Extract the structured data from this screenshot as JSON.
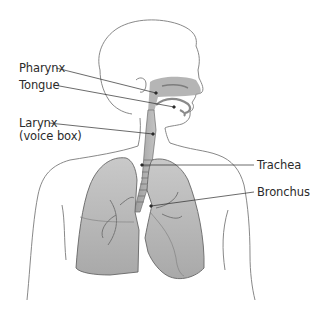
{
  "diagram": {
    "labels": [
      {
        "id": "pharynx",
        "text": "Pharynx",
        "x": 19,
        "y": 62,
        "anchor": [
          56,
          68
        ],
        "target": [
          156,
          93
        ]
      },
      {
        "id": "tongue",
        "text": "Tongue",
        "x": 19,
        "y": 79,
        "anchor": [
          54,
          85
        ],
        "target": [
          174,
          107
        ]
      },
      {
        "id": "larynx",
        "text": "Larynx",
        "sub": "(voice box)",
        "x": 19,
        "y": 117,
        "anchor": [
          49,
          123
        ],
        "target": [
          153,
          134
        ]
      },
      {
        "id": "trachea",
        "text": "Trachea",
        "x": 257,
        "y": 159,
        "anchor": [
          254,
          165
        ],
        "target": [
          142,
          165
        ]
      },
      {
        "id": "bronchus",
        "text": "Bronchus",
        "x": 257,
        "y": 186,
        "anchor": [
          254,
          192
        ],
        "target": [
          151,
          206
        ]
      }
    ],
    "colors": {
      "outline": "#6b6b6b",
      "organ_fill": "#b9b9b9",
      "organ_dark": "#8e8e8e",
      "leader": "#2b2b2b",
      "text": "#2b2b2b"
    }
  }
}
